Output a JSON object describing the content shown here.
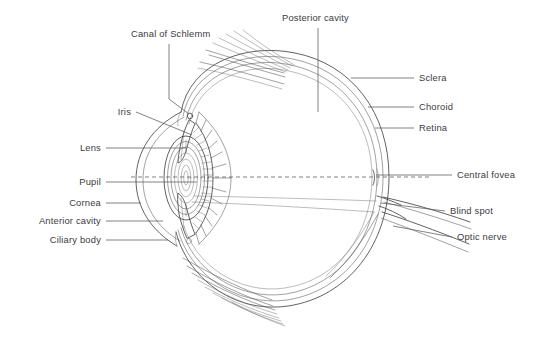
{
  "figure": {
    "background_color": "#ffffff",
    "line_color": "#3a3a3c",
    "text_color": "#3b3b3f"
  },
  "labels": {
    "canal_of_schlemm": "Canal of Schlemm",
    "posterior_cavity": "Posterior cavity",
    "iris": "Iris",
    "lens": "Lens",
    "pupil": "Pupil",
    "cornea": "Cornea",
    "anterior_cavity": "Anterior cavity",
    "ciliary_body": "Ciliary body",
    "sclera": "Sclera",
    "choroid": "Choroid",
    "retina": "Retina",
    "central_fovea": "Central fovea",
    "blind_spot": "Blind spot",
    "optic_nerve": "Optic nerve"
  },
  "label_positions": {
    "canal_of_schlemm": {
      "x": 131,
      "y": 37,
      "anchor": "start"
    },
    "posterior_cavity": {
      "x": 282,
      "y": 21,
      "anchor": "start"
    },
    "iris": {
      "x": 131,
      "y": 115,
      "anchor": "end"
    },
    "lens": {
      "x": 101,
      "y": 151,
      "anchor": "end"
    },
    "pupil": {
      "x": 101,
      "y": 185,
      "anchor": "end"
    },
    "cornea": {
      "x": 101,
      "y": 206,
      "anchor": "end"
    },
    "anterior_cavity": {
      "x": 101,
      "y": 224,
      "anchor": "end"
    },
    "ciliary_body": {
      "x": 101,
      "y": 243,
      "anchor": "end"
    },
    "sclera": {
      "x": 419,
      "y": 81,
      "anchor": "start"
    },
    "choroid": {
      "x": 419,
      "y": 110,
      "anchor": "start"
    },
    "retina": {
      "x": 419,
      "y": 131,
      "anchor": "start"
    },
    "central_fovea": {
      "x": 457,
      "y": 178,
      "anchor": "start"
    },
    "blind_spot": {
      "x": 450,
      "y": 214,
      "anchor": "start"
    },
    "optic_nerve": {
      "x": 457,
      "y": 240,
      "anchor": "start"
    }
  },
  "structures": [
    {
      "name": "sclera",
      "description": "outermost white fibrous coat of the eyeball"
    },
    {
      "name": "choroid",
      "description": "middle vascular layer"
    },
    {
      "name": "retina",
      "description": "innermost light-sensitive layer"
    },
    {
      "name": "cornea",
      "description": "transparent anterior curvature"
    },
    {
      "name": "iris",
      "description": "pigmented diaphragm anterior to the lens"
    },
    {
      "name": "pupil",
      "description": "central aperture of the iris"
    },
    {
      "name": "lens",
      "description": "biconvex refracting body with concentric lamellae"
    },
    {
      "name": "ciliary-body",
      "description": "scalloped ring of ciliary processes and muscle"
    },
    {
      "name": "canal-of-schlemm",
      "description": "small circular canal at the iridocorneal angle"
    },
    {
      "name": "anterior-cavity",
      "description": "space between cornea and lens"
    },
    {
      "name": "posterior-cavity",
      "description": "vitreous chamber behind the lens"
    },
    {
      "name": "central-fovea",
      "description": "retinal depression at the visual axis"
    },
    {
      "name": "blind-spot",
      "description": "optic disc where nerve fibres exit"
    },
    {
      "name": "optic-nerve",
      "description": "nerve trunk leaving the posterior globe"
    },
    {
      "name": "extraocular-muscle",
      "description": "fanned muscle fibres above and below the globe"
    },
    {
      "name": "optical-axis",
      "description": "dashed horizontal visual axis"
    }
  ]
}
